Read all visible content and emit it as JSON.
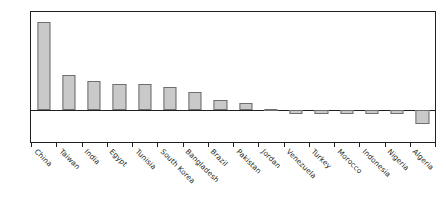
{
  "chart_data": {
    "type": "bar",
    "title": "",
    "subtitle": "",
    "xlabel": "",
    "ylabel": "",
    "ylim": [
      -2.0,
      6.0
    ],
    "grid": false,
    "legend": "none",
    "bar_color": "#c9c9c9",
    "bar_edge_color": "#6d6e71",
    "axis_color": "#231f20",
    "ytick_labels": [
      "6.0",
      "5.0",
      "4.0",
      "3.0",
      "2.0",
      "1.0",
      "0.0",
      "-1.0",
      "-2.0"
    ],
    "ytick_values": [
      6.0,
      5.0,
      4.0,
      3.0,
      2.0,
      1.0,
      0.0,
      -1.0,
      -2.0
    ],
    "categories": [
      "China",
      "Taiwan",
      "India",
      "Egypt",
      "Tunisia",
      "South Korea",
      "Bangladesh",
      "Brazil",
      "Pakistan",
      "Jordan",
      "Venezuela",
      "Turkey",
      "Morocco",
      "Indonesia",
      "Nigeria",
      "Algeria"
    ],
    "values": [
      5.4,
      2.1,
      1.75,
      1.6,
      1.6,
      1.4,
      1.05,
      0.6,
      0.4,
      0.03,
      -0.3,
      -0.3,
      -0.3,
      -0.3,
      -0.3,
      -0.9
    ]
  }
}
